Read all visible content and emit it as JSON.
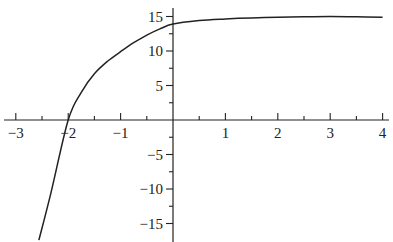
{
  "chart_data": {
    "type": "line",
    "title": "",
    "xlabel": "",
    "ylabel": "",
    "xlim": [
      -3.2,
      4.1
    ],
    "ylim": [
      -17.5,
      16.5
    ],
    "grid": false,
    "legend": null,
    "x_ticks": [
      -3,
      -2,
      -1,
      1,
      2,
      3,
      4
    ],
    "x_tick_labels": [
      "−3",
      "−2",
      "−1",
      "1",
      "2",
      "3",
      "4"
    ],
    "x_minor_ticks": [
      -2.5,
      -1.5,
      -0.5,
      0.5,
      1.5,
      2.5,
      3.5
    ],
    "y_ticks": [
      15,
      10,
      5,
      -5,
      -10,
      -15
    ],
    "y_tick_labels": [
      "15",
      "10",
      "5",
      "−5",
      "−10",
      "−15"
    ],
    "y_minor_ticks": [
      12.5,
      7.5,
      2.5,
      -2.5,
      -7.5,
      -12.5
    ],
    "series": [
      {
        "name": "curve",
        "x": [
          -2.56,
          -2.33,
          -2.0,
          -1.75,
          -1.5,
          -1.25,
          -1.0,
          -0.75,
          -0.5,
          -0.25,
          0,
          0.5,
          1,
          1.5,
          2,
          2.5,
          3,
          3.5,
          4
        ],
        "y": [
          -17.4,
          -10.6,
          0,
          4.0,
          6.7,
          8.5,
          9.9,
          11.2,
          12.3,
          13.2,
          13.9,
          14.4,
          14.65,
          14.8,
          14.9,
          14.95,
          15.0,
          14.95,
          14.9
        ]
      }
    ],
    "color": "#222222"
  }
}
